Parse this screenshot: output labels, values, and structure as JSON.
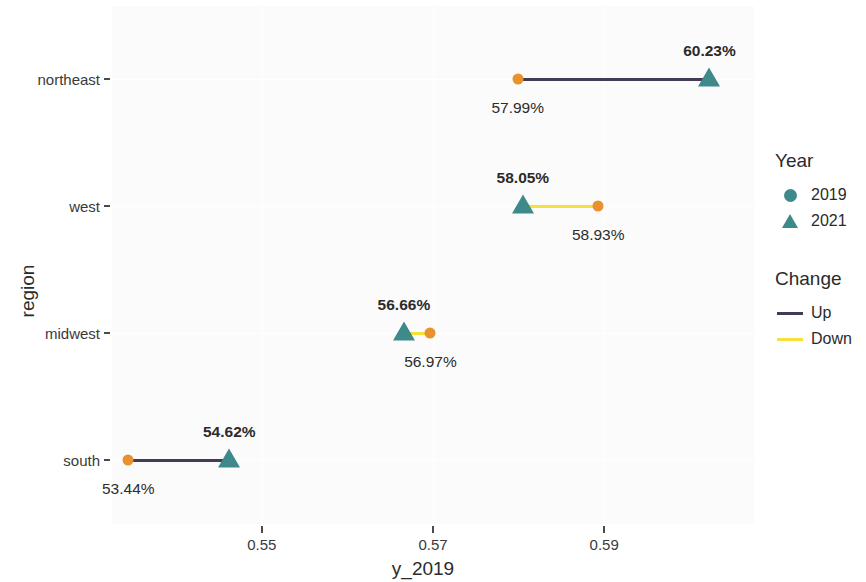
{
  "chart_data": {
    "type": "scatter",
    "subtype": "dumbbell",
    "title": "",
    "xlabel": "y_2019",
    "ylabel": "region",
    "xlim": [
      0.5325,
      0.6075
    ],
    "xticks": [
      0.55,
      0.57,
      0.59
    ],
    "xtick_labels": [
      "0.55",
      "0.57",
      "0.59"
    ],
    "categories": [
      "northeast",
      "west",
      "midwest",
      "south"
    ],
    "grid": true,
    "legend_position": "right",
    "series": [
      {
        "name": "2019",
        "marker": "circle",
        "color": "#e8912d",
        "values": [
          0.5799,
          0.5893,
          0.5697,
          0.5344
        ]
      },
      {
        "name": "2021",
        "marker": "triangle",
        "color": "#3e8a8a",
        "values": [
          0.6023,
          0.5805,
          0.5666,
          0.5462
        ]
      }
    ],
    "points": [
      {
        "category": "northeast",
        "y_2019": 0.5799,
        "y_2021": 0.6023,
        "label_2019": "57.99%",
        "label_2021": "60.23%",
        "change": "Up",
        "line_color": "#453a55"
      },
      {
        "category": "west",
        "y_2019": 0.5893,
        "y_2021": 0.5805,
        "label_2019": "58.93%",
        "label_2021": "58.05%",
        "change": "Down",
        "line_color": "#f5e03c"
      },
      {
        "category": "midwest",
        "y_2019": 0.5697,
        "y_2021": 0.5666,
        "label_2019": "56.97%",
        "label_2021": "56.66%",
        "change": "Down",
        "line_color": "#f5e03c"
      },
      {
        "category": "south",
        "y_2019": 0.5344,
        "y_2021": 0.5462,
        "label_2019": "53.44%",
        "label_2021": "54.62%",
        "change": "Up",
        "line_color": "#453a55"
      }
    ]
  },
  "axes": {
    "y_title": "region",
    "x_title": "y_2019",
    "y_tick_labels": [
      "northeast",
      "west",
      "midwest",
      "south"
    ],
    "x_tick_labels": [
      "0.55",
      "0.57",
      "0.59"
    ]
  },
  "legend": {
    "year": {
      "title": "Year",
      "items": [
        {
          "label": "2019",
          "marker": "circle"
        },
        {
          "label": "2021",
          "marker": "triangle"
        }
      ]
    },
    "change": {
      "title": "Change",
      "items": [
        {
          "label": "Up",
          "color": "#453a55"
        },
        {
          "label": "Down",
          "color": "#f5e03c"
        }
      ]
    }
  },
  "colors": {
    "year_2019": "#e8912d",
    "year_2021": "#3e8a8a",
    "legend_marker": "#3e8a8a",
    "up": "#453a55",
    "down": "#f5e03c",
    "panel_bg": "#fbfbfc",
    "grid": "#ffffff"
  },
  "labels": {
    "northeast_2021": "60.23%",
    "northeast_2019": "57.99%",
    "west_2021": "58.05%",
    "west_2019": "58.93%",
    "midwest_2021": "56.66%",
    "midwest_2019": "56.97%",
    "south_2021": "54.62%",
    "south_2019": "53.44%"
  }
}
